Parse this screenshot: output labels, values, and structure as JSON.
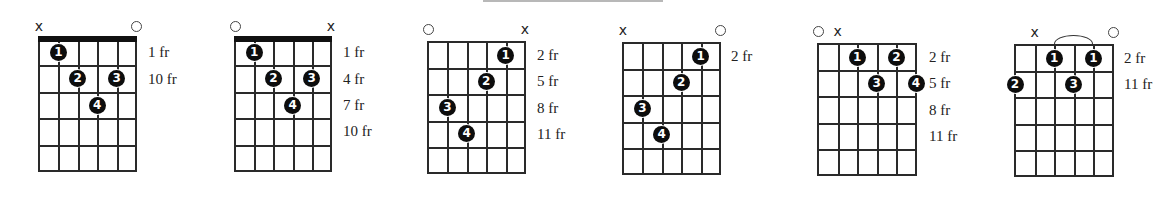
{
  "diagrams": [
    {
      "id": 1,
      "grid": {
        "x": 38,
        "y": 38,
        "w": 99,
        "h": 134
      },
      "nut": true,
      "markers": [
        {
          "string": 1,
          "type": "x",
          "label": "x"
        },
        {
          "string": 6,
          "type": "open",
          "label": "o"
        }
      ],
      "fingers": [
        {
          "finger": "1",
          "string": 2,
          "fret": 1
        },
        {
          "finger": "2",
          "string": 3,
          "fret": 2
        },
        {
          "finger": "3",
          "string": 5,
          "fret": 2
        },
        {
          "finger": "4",
          "string": 4,
          "fret": 3
        }
      ],
      "barre_arc": null,
      "labels_x": 148,
      "fret_labels": [
        {
          "text": "1 fr",
          "row": 1
        },
        {
          "text": "10 fr",
          "row": 2
        }
      ]
    },
    {
      "id": 2,
      "grid": {
        "x": 234,
        "y": 38,
        "w": 98,
        "h": 134
      },
      "nut": true,
      "markers": [
        {
          "string": 1,
          "type": "open",
          "label": "o"
        },
        {
          "string": 6,
          "type": "x",
          "label": "x"
        }
      ],
      "fingers": [
        {
          "finger": "1",
          "string": 2,
          "fret": 1
        },
        {
          "finger": "2",
          "string": 3,
          "fret": 2
        },
        {
          "finger": "3",
          "string": 5,
          "fret": 2
        },
        {
          "finger": "4",
          "string": 4,
          "fret": 3
        }
      ],
      "barre_arc": null,
      "labels_x": 343,
      "fret_labels": [
        {
          "text": "1 fr",
          "row": 1
        },
        {
          "text": "4 fr",
          "row": 2
        },
        {
          "text": "7 fr",
          "row": 3
        },
        {
          "text": "10 fr",
          "row": 4
        }
      ]
    },
    {
      "id": 3,
      "grid": {
        "x": 427,
        "y": 41,
        "w": 99,
        "h": 133
      },
      "nut": false,
      "markers": [
        {
          "string": 1,
          "type": "open",
          "label": "o"
        },
        {
          "string": 6,
          "type": "x",
          "label": "x"
        }
      ],
      "fingers": [
        {
          "finger": "1",
          "string": 5,
          "fret": 1
        },
        {
          "finger": "2",
          "string": 4,
          "fret": 2
        },
        {
          "finger": "3",
          "string": 2,
          "fret": 3
        },
        {
          "finger": "4",
          "string": 3,
          "fret": 4
        }
      ],
      "barre_arc": null,
      "labels_x": 537,
      "fret_labels": [
        {
          "text": "2 fr",
          "row": 1
        },
        {
          "text": "5 fr",
          "row": 2
        },
        {
          "text": "8 fr",
          "row": 3
        },
        {
          "text": "11 fr",
          "row": 4
        }
      ]
    },
    {
      "id": 4,
      "grid": {
        "x": 622,
        "y": 42,
        "w": 99,
        "h": 133
      },
      "nut": false,
      "markers": [
        {
          "string": 1,
          "type": "x",
          "label": "x"
        },
        {
          "string": 6,
          "type": "open",
          "label": "o"
        }
      ],
      "fingers": [
        {
          "finger": "1",
          "string": 5,
          "fret": 1
        },
        {
          "finger": "2",
          "string": 4,
          "fret": 2
        },
        {
          "finger": "3",
          "string": 2,
          "fret": 3
        },
        {
          "finger": "4",
          "string": 3,
          "fret": 4
        }
      ],
      "barre_arc": null,
      "labels_x": 731,
      "fret_labels": [
        {
          "text": "2 fr",
          "row": 1
        }
      ]
    },
    {
      "id": 5,
      "grid": {
        "x": 817,
        "y": 43,
        "w": 100,
        "h": 133
      },
      "nut": false,
      "markers": [
        {
          "string": 1,
          "type": "open",
          "label": "o"
        },
        {
          "string": 2,
          "type": "x",
          "label": "x"
        }
      ],
      "fingers": [
        {
          "finger": "1",
          "string": 3,
          "fret": 1
        },
        {
          "finger": "2",
          "string": 5,
          "fret": 1
        },
        {
          "finger": "3",
          "string": 4,
          "fret": 2
        },
        {
          "finger": "4",
          "string": 6,
          "fret": 2
        }
      ],
      "barre_arc": null,
      "labels_x": 929,
      "fret_labels": [
        {
          "text": "2 fr",
          "row": 1
        },
        {
          "text": "5 fr",
          "row": 2
        },
        {
          "text": "8 fr",
          "row": 3
        },
        {
          "text": "11 fr",
          "row": 4
        }
      ]
    },
    {
      "id": 6,
      "grid": {
        "x": 1014,
        "y": 44,
        "w": 100,
        "h": 133
      },
      "nut": false,
      "markers": [
        {
          "string": 2,
          "type": "x",
          "label": "x"
        },
        {
          "string": 6,
          "type": "open",
          "label": "o"
        }
      ],
      "fingers": [
        {
          "finger": "1",
          "string": 3,
          "fret": 1
        },
        {
          "finger": "1",
          "string": 5,
          "fret": 1
        },
        {
          "finger": "2",
          "string": 1,
          "fret": 2
        },
        {
          "finger": "3",
          "string": 4,
          "fret": 2
        }
      ],
      "barre_arc": {
        "from_string": 3,
        "to_string": 5
      },
      "labels_x": 1124,
      "fret_labels": [
        {
          "text": "2 fr",
          "row": 1
        },
        {
          "text": "11 fr",
          "row": 2
        }
      ]
    }
  ],
  "colors": {
    "line": "#2a2a2a",
    "dot": "#0d0d0d",
    "dot_text": "#ffffff",
    "text": "#222222",
    "background": "#ffffff"
  }
}
